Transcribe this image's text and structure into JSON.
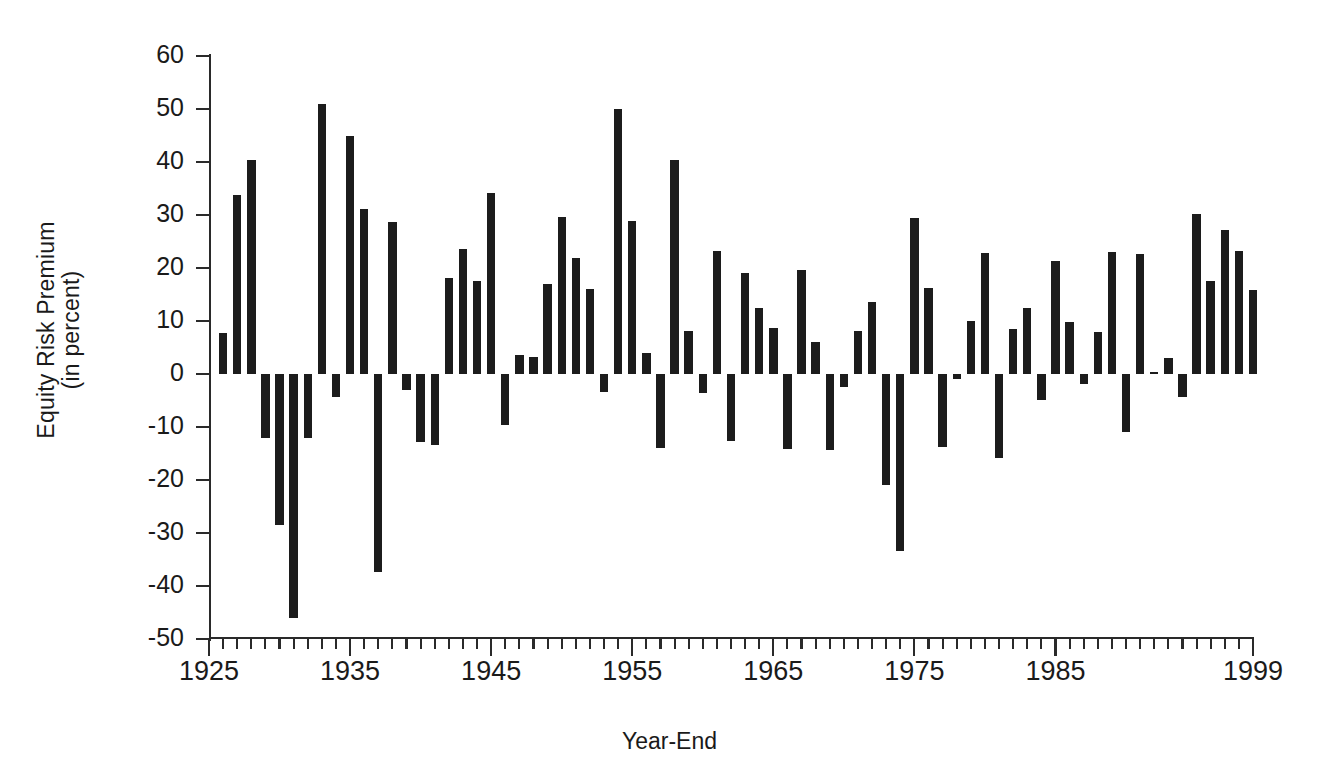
{
  "chart_data": {
    "type": "bar",
    "title": "",
    "xlabel": "Year-End",
    "ylabel": "Equity Risk Premium\n(in percent)",
    "ylim": [
      -50,
      60
    ],
    "ytick_values": [
      60,
      50,
      40,
      30,
      20,
      10,
      0,
      -10,
      -20,
      -30,
      -40,
      -50
    ],
    "ytick_labels": [
      "60",
      "50",
      "40",
      "30",
      "20",
      "10",
      "0",
      "-10",
      "-20",
      "-30",
      "-40",
      "-50"
    ],
    "xlim": [
      1925,
      1999
    ],
    "xtick_labels": [
      "1925",
      "1935",
      "1945",
      "1955",
      "1965",
      "1975",
      "1985",
      "1999"
    ],
    "xtick_label_years": [
      1925,
      1935,
      1945,
      1955,
      1965,
      1975,
      1985,
      1999
    ],
    "xtick_minor_step": 1,
    "grid": false,
    "legend": null,
    "bar_color": "#1c1c1c",
    "axis_color": "#2a2a2a",
    "background": "#ffffff",
    "categories": [
      1926,
      1927,
      1928,
      1929,
      1930,
      1931,
      1932,
      1933,
      1934,
      1935,
      1936,
      1937,
      1938,
      1939,
      1940,
      1941,
      1942,
      1943,
      1944,
      1945,
      1946,
      1947,
      1948,
      1949,
      1950,
      1951,
      1952,
      1953,
      1954,
      1955,
      1956,
      1957,
      1958,
      1959,
      1960,
      1961,
      1962,
      1963,
      1964,
      1965,
      1966,
      1967,
      1968,
      1969,
      1970,
      1971,
      1972,
      1973,
      1974,
      1975,
      1976,
      1977,
      1978,
      1979,
      1980,
      1981,
      1982,
      1983,
      1984,
      1985,
      1986,
      1987,
      1988,
      1989,
      1990,
      1991,
      1992,
      1993,
      1994,
      1995,
      1996,
      1997,
      1998,
      1999
    ],
    "values": [
      7.7,
      33.8,
      40.4,
      -12.1,
      -28.4,
      -46.0,
      -12.0,
      51.0,
      -4.4,
      45.0,
      31.2,
      -37.3,
      28.6,
      -3.1,
      -12.8,
      -13.4,
      18.1,
      23.6,
      17.5,
      34.1,
      -9.7,
      3.5,
      3.3,
      17.0,
      29.6,
      21.8,
      16.0,
      -3.4,
      50.0,
      28.9,
      3.9,
      -14.0,
      40.3,
      8.1,
      -3.5,
      23.2,
      -12.7,
      19.1,
      12.5,
      8.7,
      -14.2,
      19.6,
      6.1,
      -14.3,
      -2.5,
      8.2,
      13.5,
      -20.9,
      -33.4,
      29.4,
      16.3,
      -13.8,
      -0.9,
      10.0,
      22.8,
      -15.9,
      8.4,
      12.5,
      -4.9,
      21.3,
      9.9,
      -1.8,
      8.0,
      23.1,
      -10.9,
      22.6,
      0.4,
      3.0,
      -4.3,
      30.2,
      17.5,
      27.1,
      23.3,
      15.9
    ]
  },
  "axes": {
    "y_label": "Equity Risk Premium\n(in percent)",
    "x_label": "Year-End"
  }
}
